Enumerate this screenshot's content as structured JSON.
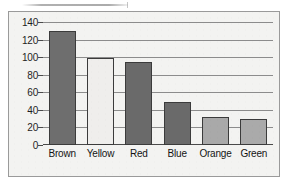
{
  "chart_data": {
    "type": "bar",
    "title": "",
    "xlabel": "",
    "ylabel": "",
    "categories": [
      "Brown",
      "Yellow",
      "Red",
      "Blue",
      "Orange",
      "Green"
    ],
    "values": [
      130,
      99,
      95,
      49,
      32,
      30
    ],
    "ylim": [
      0,
      140
    ],
    "ytick_labels": [
      "140",
      "120",
      "100",
      "80",
      "60",
      "40",
      "20",
      "0"
    ],
    "ytick_values": [
      140,
      120,
      100,
      80,
      60,
      40,
      20,
      0
    ],
    "grid": true,
    "legend": "none",
    "bar_colors": [
      "#6e6e6e",
      "#efeeec",
      "#6a6a6a",
      "#6a6a6a",
      "#a9a9a9",
      "#aaaaaa"
    ],
    "bar_outline_color": "#3b3b3b",
    "plot_background": "#f3f3f1",
    "grid_color": "#8c8c8c",
    "axis_color": "#4a4a4a",
    "frame_border_color": "#9a9a9a"
  }
}
